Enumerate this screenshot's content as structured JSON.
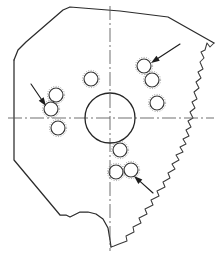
{
  "figure": {
    "width": 222,
    "height": 257,
    "background_color": "#ffffff",
    "line_color": "#2b2b2b",
    "centerline_color": "#555555",
    "annotation_color": "#1d1d1d"
  },
  "geometry": {
    "central_bore": {
      "label": "central-bore",
      "center_x": 110,
      "center_y": 118,
      "radius": 25
    },
    "centerlines": [
      {
        "label": "horizontal-centerline",
        "x1": 8,
        "y1": 118,
        "x2": 214,
        "y2": 118
      },
      {
        "label": "vertical-centerline",
        "x1": 110,
        "y1": 6,
        "x2": 110,
        "y2": 251
      }
    ],
    "outline_points": "M 14,60 L 18,50 L 26,42 L 63,10 L 70,7 L 120,11 L 168,17 L 214,43",
    "fracture_points": "M 214,43 L 210,47 L 207,43 L 205,50 L 201,52 L 204,58 L 200,62 L 203,69 L 198,72 L 201,78 L 196,82 L 199,88 L 194,92 L 197,99 L 192,102 L 195,108 L 190,112 L 193,118 L 188,121 L 191,127 L 186,130 L 189,136 L 183,139 L 186,144 L 180,147 L 183,152 L 176,155 L 179,160 L 172,164 L 175,169 L 168,173 L 170,178 L 163,182 L 165,187 L 157,191 L 159,196 L 151,200 L 153,205 L 145,209 L 147,214 L 139,218 L 141,223 L 133,227 L 134,232 L 126,236 L 127,241 L 119,244 L 114,246 L 111,247",
    "bottom_left_points": "M 111,247 L 110,240 L 108,228 L 103,219 L 96,214 L 88,212 L 80,212 L 74,215 L 70,217 L 66,215 L 60,215 L 14,160 L 14,60",
    "left_edge_note": "straight-vertical-left-edge"
  },
  "holes": [
    {
      "label": "hole-1",
      "cx": 56,
      "cy": 95,
      "r": 7
    },
    {
      "label": "hole-2",
      "cx": 51,
      "cy": 109,
      "r": 7
    },
    {
      "label": "hole-3",
      "cx": 58,
      "cy": 128,
      "r": 7
    },
    {
      "label": "hole-4",
      "cx": 91,
      "cy": 79,
      "r": 7
    },
    {
      "label": "hole-5",
      "cx": 144,
      "cy": 66,
      "r": 7
    },
    {
      "label": "hole-6",
      "cx": 152,
      "cy": 80,
      "r": 7
    },
    {
      "label": "hole-7",
      "cx": 157,
      "cy": 103,
      "r": 7
    },
    {
      "label": "hole-8",
      "cx": 120,
      "cy": 150,
      "r": 7
    },
    {
      "label": "hole-9",
      "cx": 116,
      "cy": 172,
      "r": 7
    },
    {
      "label": "hole-10",
      "cx": 131,
      "cy": 170,
      "r": 7
    }
  ],
  "leaders": [
    {
      "label": "leader-arrow-upper-right",
      "tail_x": 180,
      "tail_y": 44,
      "tip_x": 151,
      "tip_y": 63,
      "points_to": "hole-5"
    },
    {
      "label": "leader-arrow-left",
      "tail_x": 31,
      "tail_y": 84,
      "tip_x": 46,
      "tip_y": 106,
      "points_to": "hole-2"
    },
    {
      "label": "leader-arrow-lower",
      "tail_x": 153,
      "tail_y": 193,
      "tip_x": 134,
      "tip_y": 176,
      "points_to": "hole-10"
    }
  ]
}
